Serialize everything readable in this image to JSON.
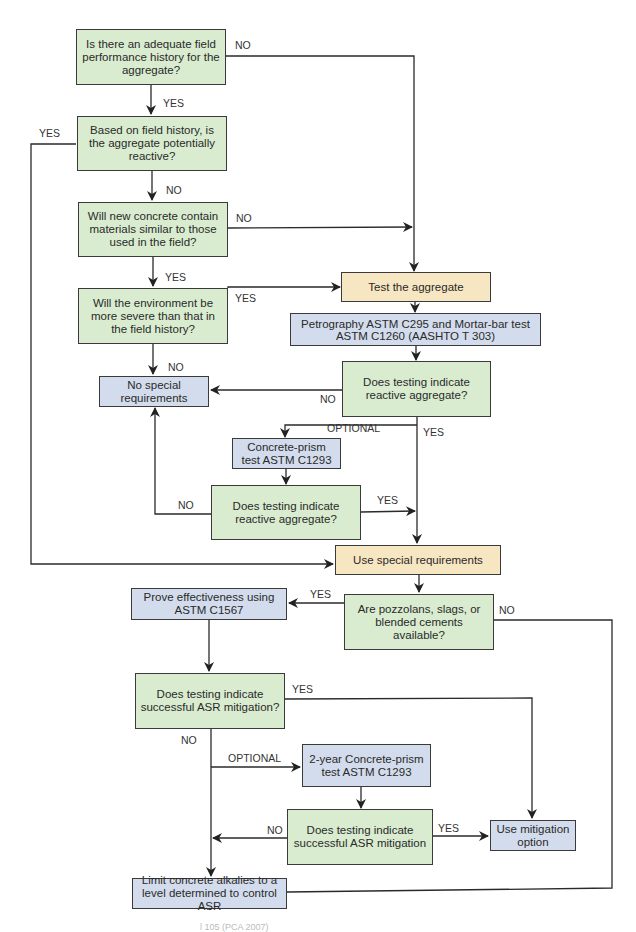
{
  "diagram": {
    "type": "flowchart",
    "colors": {
      "decision_fill": "#d9ecd0",
      "process_fill": "#d3dcec",
      "action_fill": "#f7e6c2",
      "line": "#2a2a2a"
    },
    "nodes": {
      "q_field_history": "Is there an adequate field performance history for the aggregate?",
      "q_potentially_reactive": "Based on field history, is the aggregate potentially reactive?",
      "q_similar_materials": "Will new concrete contain materials similar to those used in the field?",
      "q_environment": "Will the environment be more severe than that in the field history?",
      "no_special": "No special requirements",
      "test_aggregate": "Test the aggregate",
      "petrography": "Petrography ASTM C295 and Mortar-bar test ASTM C1260 (AASHTO T 303)",
      "q_reactive_1": "Does testing indicate reactive aggregate?",
      "concrete_prism": "Concrete-prism test ASTM C1293",
      "q_reactive_2": "Does testing indicate reactive aggregate?",
      "use_special": "Use special requirements",
      "q_pozzolans": "Are pozzolans, slags, or blended cements available?",
      "prove_effectiveness": "Prove effectiveness using ASTM C1567",
      "q_asr_1": "Does testing indicate successful ASR mitigation?",
      "two_year_prism": "2-year Concrete-prism test ASTM C1293",
      "q_asr_2": "Does testing indicate successful ASR mitigation",
      "use_mitigation": "Use mitigation option",
      "limit_alkalies": "Limit concrete alkalies to a level determined to control ASR"
    },
    "labels": {
      "no_1": "NO",
      "yes_1": "YES",
      "yes_left": "YES",
      "no_2": "NO",
      "no_3": "NO",
      "yes_2": "YES",
      "yes_3": "YES",
      "no_4": "NO",
      "no_5": "NO",
      "optional_1": "OPTIONAL",
      "yes_4": "YES",
      "no_6": "NO",
      "yes_5": "YES",
      "yes_6": "YES",
      "no_7": "NO",
      "yes_7": "YES",
      "no_8": "NO",
      "optional_2": "OPTIONAL",
      "no_9": "NO",
      "yes_8": "YES"
    },
    "caption": "l 105 (PCA 2007)"
  }
}
